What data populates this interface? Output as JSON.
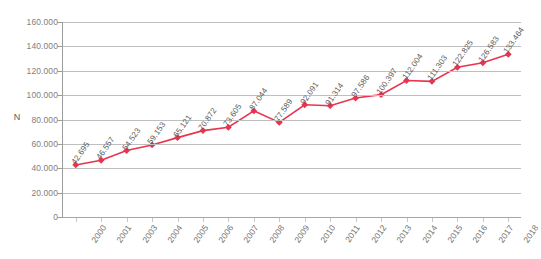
{
  "chart_data": {
    "type": "line",
    "title": "",
    "xlabel": "",
    "ylabel": "N",
    "categories": [
      "2000",
      "2001",
      "2003",
      "2004",
      "2005",
      "2006",
      "2007",
      "2008",
      "2009",
      "2010",
      "2011",
      "2012",
      "2013",
      "2014",
      "2015",
      "2016",
      "2017",
      "2018"
    ],
    "values": [
      42695,
      46557,
      54523,
      59153,
      65121,
      70872,
      73605,
      87044,
      77589,
      92091,
      91314,
      97586,
      100397,
      112004,
      111303,
      122825,
      126583,
      133464
    ],
    "point_labels": [
      "42.695",
      "46.557",
      "54.523",
      "59.153",
      "65.121",
      "70.872",
      "73.605",
      "87.044",
      "77.589",
      "92.091",
      "91.314",
      "97.586",
      "100.397",
      "112.004",
      "111.303",
      "122.825",
      "126.583",
      "133.464"
    ],
    "ylim": [
      0,
      160000
    ],
    "ytick_values": [
      0,
      20000,
      40000,
      60000,
      80000,
      100000,
      120000,
      140000,
      160000
    ],
    "ytick_labels": [
      "0",
      "20.000",
      "40.000",
      "60.000",
      "80.000",
      "100.000",
      "120.000",
      "140.000",
      "160.000"
    ],
    "grid": true,
    "legend": "none",
    "series_color": "#E8344E",
    "marker": "diamond",
    "series": [
      {
        "name": "N",
        "values": [
          42695,
          46557,
          54523,
          59153,
          65121,
          70872,
          73605,
          87044,
          77589,
          92091,
          91314,
          97586,
          100397,
          112004,
          111303,
          122825,
          126583,
          133464
        ]
      }
    ]
  }
}
